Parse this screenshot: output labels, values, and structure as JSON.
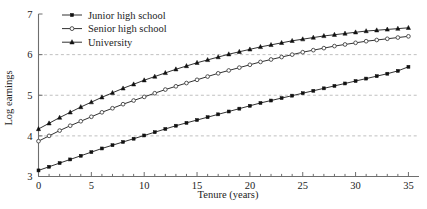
{
  "chart_data": {
    "type": "line",
    "title": "",
    "xlabel": "Tenure (years)",
    "ylabel": "Log earnings",
    "xlim": [
      0,
      36
    ],
    "ylim": [
      3,
      7
    ],
    "xticks": [
      0,
      5,
      10,
      15,
      20,
      25,
      30,
      35
    ],
    "xtick_labels": [
      "0",
      "5",
      "10",
      "15",
      "20",
      "25",
      "30",
      "35"
    ],
    "yticks": [
      3,
      4,
      5,
      6,
      7
    ],
    "ytick_labels": [
      "3",
      "4",
      "5",
      "6",
      "7"
    ],
    "minor_xtick_step": 1,
    "grid": "horizontal dashed gridlines at y = 4, 5, 6",
    "legend_position": "top-left inside axes",
    "x": [
      0,
      1,
      2,
      3,
      4,
      5,
      6,
      7,
      8,
      9,
      10,
      11,
      12,
      13,
      14,
      15,
      16,
      17,
      18,
      19,
      20,
      21,
      22,
      23,
      24,
      25,
      26,
      27,
      28,
      29,
      30,
      31,
      32,
      33,
      34,
      35
    ],
    "series": [
      {
        "name": "Junior high school",
        "marker": "filled-square",
        "values": [
          3.15,
          3.24,
          3.33,
          3.42,
          3.51,
          3.6,
          3.69,
          3.77,
          3.85,
          3.93,
          4.01,
          4.09,
          4.17,
          4.25,
          4.32,
          4.39,
          4.46,
          4.53,
          4.6,
          4.67,
          4.74,
          4.81,
          4.87,
          4.93,
          4.99,
          5.05,
          5.11,
          5.17,
          5.23,
          5.29,
          5.35,
          5.41,
          5.47,
          5.53,
          5.6,
          5.7
        ]
      },
      {
        "name": "Senior high school",
        "marker": "open-circle",
        "values": [
          3.87,
          4.0,
          4.13,
          4.25,
          4.36,
          4.47,
          4.58,
          4.68,
          4.78,
          4.87,
          4.96,
          5.05,
          5.14,
          5.22,
          5.3,
          5.38,
          5.46,
          5.54,
          5.61,
          5.68,
          5.75,
          5.82,
          5.88,
          5.94,
          6.0,
          6.06,
          6.11,
          6.16,
          6.21,
          6.25,
          6.29,
          6.33,
          6.36,
          6.39,
          6.42,
          6.45
        ]
      },
      {
        "name": "University",
        "marker": "filled-triangle",
        "values": [
          4.17,
          4.31,
          4.45,
          4.58,
          4.71,
          4.83,
          4.95,
          5.06,
          5.17,
          5.27,
          5.37,
          5.46,
          5.55,
          5.64,
          5.72,
          5.8,
          5.87,
          5.94,
          6.01,
          6.07,
          6.13,
          6.19,
          6.24,
          6.29,
          6.34,
          6.38,
          6.42,
          6.46,
          6.49,
          6.52,
          6.55,
          6.58,
          6.6,
          6.62,
          6.64,
          6.66
        ]
      }
    ]
  },
  "legend": {
    "items": [
      {
        "label": "Junior high school",
        "marker": "filled-square"
      },
      {
        "label": "Senior high school",
        "marker": "open-circle"
      },
      {
        "label": "University",
        "marker": "filled-triangle"
      }
    ]
  },
  "colors": {
    "background": "#ffffff",
    "ink": "#111111",
    "axis": "#6e6e6e",
    "gridline": "#b9b9b9"
  }
}
